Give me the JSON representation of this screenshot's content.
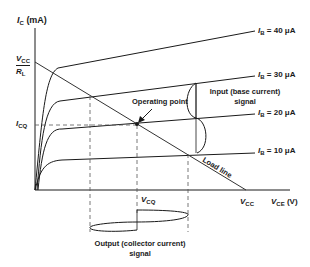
{
  "diagram": {
    "y_axis": {
      "symbol": "I",
      "subscript": "C",
      "unit": "(mA)"
    },
    "x_axis": {
      "symbol": "V",
      "subscript": "CE",
      "unit": "(V)"
    },
    "intercepts": {
      "y_top": {
        "symbol": "V",
        "subscript": "CC"
      },
      "y_bottom": {
        "symbol": "R",
        "subscript": "L"
      },
      "x": {
        "symbol": "V",
        "subscript": "CC"
      }
    },
    "quiescent": {
      "current": {
        "symbol": "I",
        "subscript": "CQ"
      },
      "voltage": {
        "symbol": "V",
        "subscript": "CQ"
      }
    },
    "curves": [
      {
        "symbol": "I",
        "subscript": "B",
        "value": "= 40 μA"
      },
      {
        "symbol": "I",
        "subscript": "B",
        "value": "= 30 μA"
      },
      {
        "symbol": "I",
        "subscript": "B",
        "value": "= 20 μA"
      },
      {
        "symbol": "I",
        "subscript": "B",
        "value": "= 10 μA"
      }
    ],
    "annotations": {
      "operating_point": "Operating point",
      "load_line": "Load line",
      "input_line1": "Input (base current)",
      "input_line2": "signal",
      "output_line1": "Output (collector current)",
      "output_line2": "signal"
    },
    "colors": {
      "line": "#1a1a1a",
      "dashed": "#555555",
      "background": "#ffffff"
    }
  }
}
